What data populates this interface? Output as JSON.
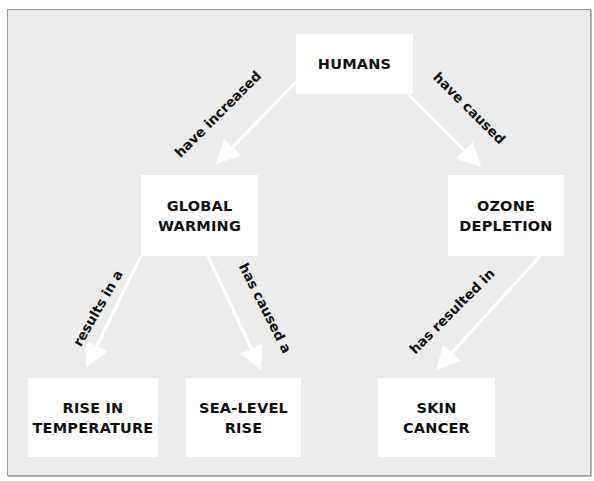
{
  "diagram": {
    "type": "concept-map",
    "background_color": "#ececec",
    "node_color": "#ffffff",
    "arrow_color": "#ffffff",
    "nodes": {
      "humans": {
        "label": "HUMANS"
      },
      "global_warming": {
        "label": "GLOBAL\nWARMING"
      },
      "ozone_depletion": {
        "label": "OZONE\nDEPLETION"
      },
      "rise_in_temperature": {
        "label": "RISE IN\nTEMPERATURE"
      },
      "sea_level_rise": {
        "label": "SEA-LEVEL\nRISE"
      },
      "skin_cancer": {
        "label": "SKIN\nCANCER"
      }
    },
    "edges": [
      {
        "from": "humans",
        "to": "global_warming",
        "label": "have increased"
      },
      {
        "from": "humans",
        "to": "ozone_depletion",
        "label": "have caused"
      },
      {
        "from": "global_warming",
        "to": "rise_in_temperature",
        "label": "results in a"
      },
      {
        "from": "global_warming",
        "to": "sea_level_rise",
        "label": "has caused a"
      },
      {
        "from": "ozone_depletion",
        "to": "skin_cancer",
        "label": "has resulted in"
      }
    ]
  }
}
